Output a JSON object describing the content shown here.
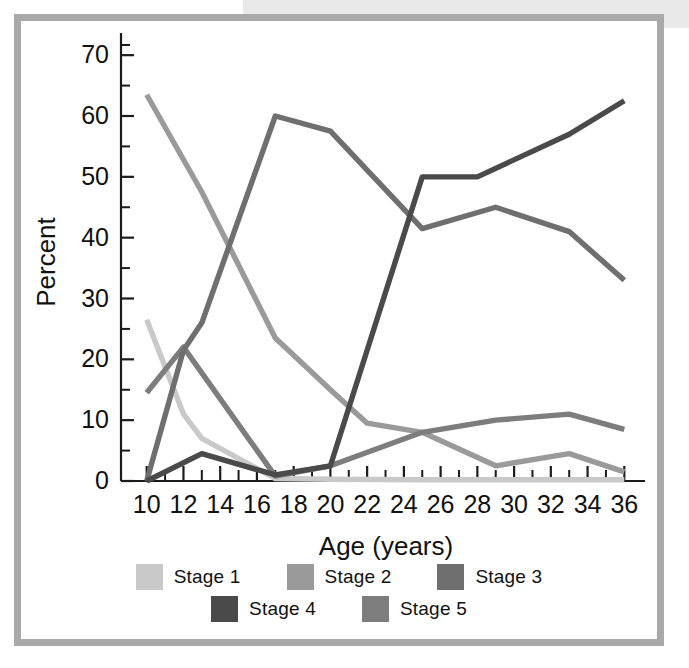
{
  "figure": {
    "frame_color": "#a9a9a9",
    "background": "#ffffff",
    "band_color": "#e9e9e9"
  },
  "legend": {
    "rows": [
      [
        {
          "label": "Stage 1",
          "color": "#c9c9c9",
          "swatch_name": "legend-swatch-stage-1"
        },
        {
          "label": "Stage 2",
          "color": "#9a9a9a",
          "swatch_name": "legend-swatch-stage-2"
        },
        {
          "label": "Stage 3",
          "color": "#6f6f6f",
          "swatch_name": "legend-swatch-stage-3"
        }
      ],
      [
        {
          "label": "Stage 4",
          "color": "#4a4a4a",
          "swatch_name": "legend-swatch-stage-4"
        },
        {
          "label": "Stage 5",
          "color": "#7d7d7d",
          "swatch_name": "legend-swatch-stage-5"
        }
      ]
    ]
  },
  "chart_data": {
    "type": "line",
    "title": "",
    "xlabel": "Age (years)",
    "ylabel": "Percent",
    "xlim": [
      8.6,
      36.8
    ],
    "ylim": [
      0,
      72
    ],
    "xticks": [
      10,
      12,
      14,
      16,
      18,
      20,
      22,
      24,
      26,
      28,
      30,
      32,
      34,
      36
    ],
    "xtick_labels": [
      "10",
      "12",
      "14",
      "16",
      "18",
      "20",
      "22",
      "24",
      "26",
      "28",
      "30",
      "32",
      "34",
      "36"
    ],
    "xminorticks": [
      11,
      13,
      15,
      17,
      19,
      21,
      23,
      25,
      27,
      29,
      31,
      33,
      35
    ],
    "yticks": [
      0,
      10,
      20,
      30,
      40,
      50,
      60,
      70
    ],
    "ytick_labels": [
      "0",
      "10",
      "20",
      "30",
      "40",
      "50",
      "60",
      "70"
    ],
    "yminorticks": [
      5,
      15,
      25,
      35,
      45,
      55,
      65
    ],
    "grid": false,
    "legend_position": "below",
    "series": [
      {
        "name": "Stage 1",
        "color": "#c9c9c9",
        "x": [
          10,
          12,
          13,
          17,
          20,
          25,
          29,
          33,
          36
        ],
        "y": [
          26.5,
          11.0,
          7.0,
          0.4,
          0.3,
          0.2,
          0.2,
          0.2,
          0.2
        ]
      },
      {
        "name": "Stage 2",
        "color": "#9a9a9a",
        "x": [
          10,
          13,
          17,
          20,
          22,
          25,
          29,
          33,
          36
        ],
        "y": [
          63.5,
          47.5,
          23.5,
          15.0,
          9.5,
          8.0,
          2.5,
          4.5,
          1.5
        ]
      },
      {
        "name": "Stage 3",
        "color": "#6f6f6f",
        "x": [
          10,
          12,
          13,
          17,
          20,
          25,
          29,
          33,
          36
        ],
        "y": [
          0.0,
          21.5,
          26.0,
          60.0,
          57.5,
          41.5,
          45.0,
          41.0,
          33.0
        ]
      },
      {
        "name": "Stage 4",
        "color": "#4a4a4a",
        "x": [
          10,
          13,
          17,
          20,
          25,
          28,
          33,
          36
        ],
        "y": [
          0.0,
          4.5,
          1.0,
          2.5,
          50.0,
          50.0,
          57.0,
          62.5
        ]
      },
      {
        "name": "Stage 5",
        "color": "#7d7d7d",
        "x": [
          10,
          12,
          17,
          20,
          25,
          29,
          33,
          36
        ],
        "y": [
          14.5,
          22.0,
          0.8,
          2.5,
          8.0,
          10.0,
          11.0,
          8.5
        ]
      }
    ]
  }
}
